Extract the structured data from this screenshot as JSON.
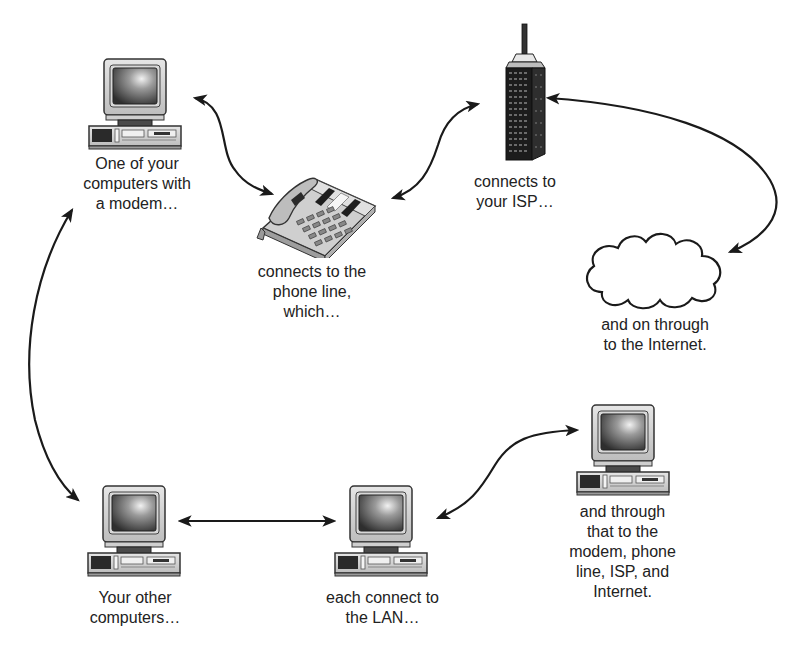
{
  "diagram": {
    "nodes": {
      "modem_computer": {
        "icon": "desktop-computer-icon",
        "caption": [
          "One of your",
          "computers with",
          "a modem…"
        ]
      },
      "phone": {
        "icon": "telephone-icon",
        "caption": [
          "connects to the",
          "phone line,",
          "which…"
        ]
      },
      "isp": {
        "icon": "skyscraper-building-icon",
        "caption": [
          "connects to",
          "your ISP…"
        ]
      },
      "internet": {
        "icon": "cloud-icon",
        "caption": [
          "and on through",
          "to the Internet."
        ]
      },
      "other_computers": {
        "icon": "desktop-computer-icon",
        "caption": [
          "Your other",
          "computers…"
        ]
      },
      "lan_computer": {
        "icon": "desktop-computer-icon",
        "caption": [
          "each connect to",
          "the LAN…"
        ]
      },
      "through_computer": {
        "icon": "desktop-computer-icon",
        "caption": [
          "and through",
          "that to the",
          "modem, phone",
          "line, ISP, and",
          "Internet."
        ]
      }
    },
    "edges": [
      {
        "from": "modem_computer",
        "to": "phone",
        "style": "double-arrow-curved"
      },
      {
        "from": "phone",
        "to": "isp",
        "style": "double-arrow-curved"
      },
      {
        "from": "isp",
        "to": "internet",
        "style": "double-arrow-curved"
      },
      {
        "from": "modem_computer",
        "to": "other_computers",
        "style": "double-arrow-curved"
      },
      {
        "from": "other_computers",
        "to": "lan_computer",
        "style": "double-arrow-straight"
      },
      {
        "from": "lan_computer",
        "to": "through_computer",
        "style": "double-arrow-curved"
      }
    ],
    "colors": {
      "line": "#1a1a1a",
      "text": "#222222",
      "background": "#ffffff"
    }
  }
}
